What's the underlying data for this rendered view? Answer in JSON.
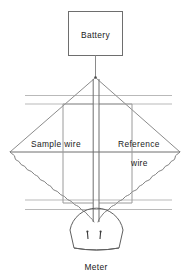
{
  "figure": {
    "title": "",
    "type": "schematic-diagram",
    "background_color": "#ffffff",
    "line_color": "#3a3a3a",
    "faint_line_color": "#b8b8b8",
    "text_color": "#1a1a1a"
  },
  "labels": {
    "battery": "Battery",
    "sample_wire": "Sample  wire",
    "reference_line1": "Reference",
    "reference_line2": "wire",
    "meter": "Meter"
  },
  "components": {
    "battery_box": {
      "x": 68,
      "y": 11,
      "width": 55,
      "height": 45
    },
    "apex": {
      "x": 95,
      "y": 78
    },
    "diamond_left": {
      "x": 10,
      "y": 152
    },
    "diamond_right": {
      "x": 180,
      "y": 152
    },
    "diamond_bottom": {
      "x": 96,
      "y": 228
    },
    "meter": {
      "cx": 96,
      "cy": 230,
      "width": 56,
      "height": 28,
      "needles": 2
    }
  },
  "horizontal_rails": [
    {
      "y": 95,
      "x1": 25,
      "x2": 172
    },
    {
      "y": 104,
      "x1": 25,
      "x2": 172
    },
    {
      "y": 200,
      "x1": 25,
      "x2": 172
    },
    {
      "y": 209,
      "x1": 25,
      "x2": 172
    }
  ],
  "center_leads": [
    {
      "x": 93,
      "y1": 78,
      "y2": 222
    },
    {
      "x": 99,
      "y1": 78,
      "y2": 222
    }
  ]
}
